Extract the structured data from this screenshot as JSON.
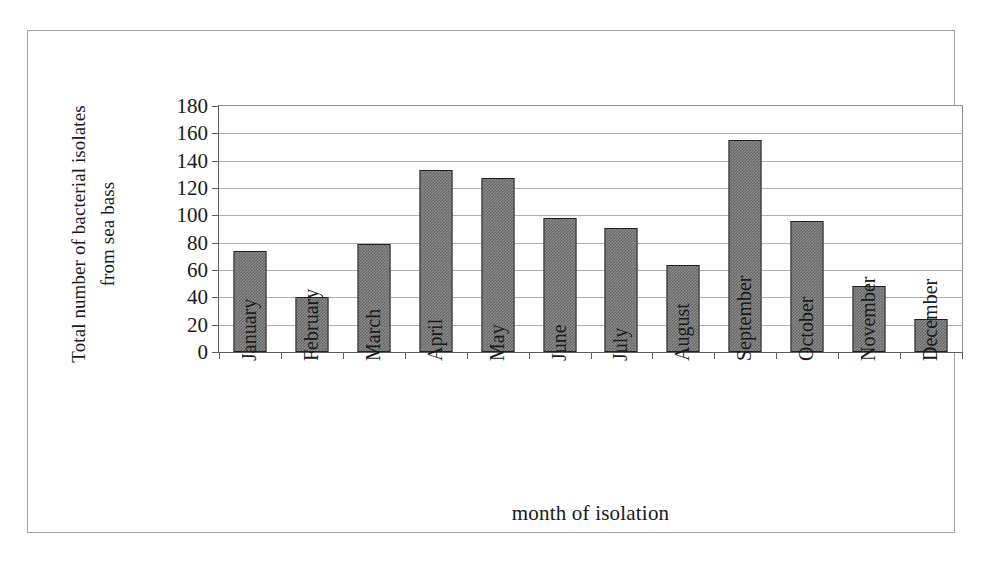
{
  "figure": {
    "background_color": "#ffffff",
    "frame_color": "#9fa3a6",
    "bar_fill_color": "#8f8f8f",
    "bar_border_color": "#202020",
    "gridline_color": "#adb0b2",
    "axis_color": "#5d5f61"
  },
  "chart_data": {
    "type": "bar",
    "title": "",
    "xlabel": "month of isolation",
    "ylabel": "Total number of bacterial isolates from sea bass",
    "ylabel_lines": [
      "Total number of bacterial isolates",
      "from sea bass"
    ],
    "categories": [
      "January",
      "February",
      "March",
      "April",
      "May",
      "June",
      "July",
      "August",
      "September",
      "October",
      "November",
      "December"
    ],
    "values": [
      74,
      40,
      79,
      133,
      127,
      98,
      91,
      64,
      155,
      96,
      48,
      24
    ],
    "ylim": [
      0,
      180
    ],
    "ytick_step": 20,
    "yticks": [
      0,
      20,
      40,
      60,
      80,
      100,
      120,
      140,
      160,
      180
    ],
    "ytick_labels": [
      "0",
      "20",
      "40",
      "60",
      "80",
      "100",
      "120",
      "140",
      "160",
      "180"
    ],
    "grid": true,
    "grid_axis": "y",
    "legend": false,
    "legend_position": "none",
    "series": [
      {
        "name": "Total bacterial isolates",
        "values": [
          74,
          40,
          79,
          133,
          127,
          98,
          91,
          64,
          155,
          96,
          48,
          24
        ]
      }
    ]
  }
}
